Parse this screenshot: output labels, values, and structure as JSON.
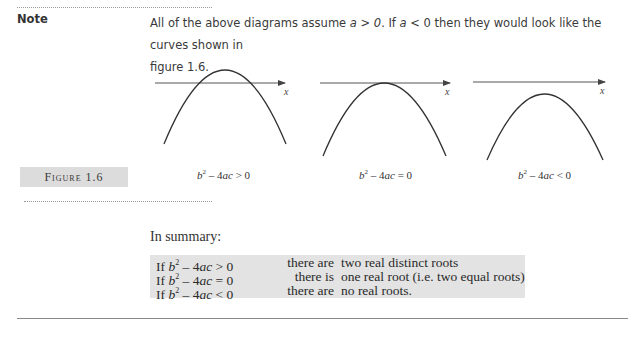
{
  "note": {
    "label": "Note",
    "text_before": "All of the above diagrams assume ",
    "cond1": "a > 0",
    "text_mid": ". If ",
    "cond2": "a",
    "text_mid2": " < 0 then they would look like the curves shown in",
    "line2": "figure 1.6."
  },
  "figure": {
    "label": "Figure 1.6",
    "axis_label": "x",
    "diagrams": [
      {
        "caption_b": "b",
        "caption_rest": " – 4",
        "caption_ac": "ac",
        "caption_rel": " > 0",
        "name": "two-roots"
      },
      {
        "caption_b": "b",
        "caption_rest": " – 4",
        "caption_ac": "ac",
        "caption_rel": " = 0",
        "name": "one-root"
      },
      {
        "caption_b": "b",
        "caption_rest": " – 4",
        "caption_ac": "ac",
        "caption_rel": " < 0",
        "name": "no-roots"
      }
    ]
  },
  "summary": {
    "label": "In summary:",
    "rows": [
      {
        "if": "If ",
        "b": "b",
        "exp": "2",
        "minus": " – 4",
        "ac": "ac",
        "rel": " > 0",
        "verb": "there are",
        "result": "two real distinct roots"
      },
      {
        "if": "If ",
        "b": "b",
        "exp": "2",
        "minus": " – 4",
        "ac": "ac",
        "rel": " = 0",
        "verb": "there is",
        "result": "one real root (i.e. two equal roots)"
      },
      {
        "if": "If ",
        "b": "b",
        "exp": "2",
        "minus": " – 4",
        "ac": "ac",
        "rel": " < 0",
        "verb": "there are",
        "result": "no real roots."
      }
    ]
  },
  "colors": {
    "label_box_bg": "#dcdcdc",
    "summary_box_bg": "#e3e3e3",
    "curve": "#333333",
    "axis": "#555555"
  }
}
